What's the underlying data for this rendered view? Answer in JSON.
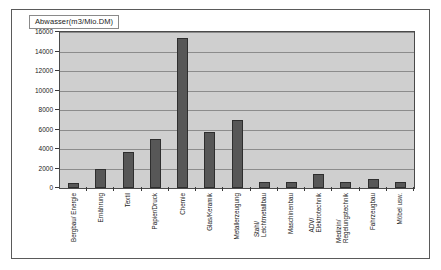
{
  "chart_data": {
    "type": "bar",
    "title": "Abwasser(m3/Mio.DM)",
    "xlabel": "",
    "ylabel": "",
    "ylim": [
      0,
      16000
    ],
    "ytick_step": 2000,
    "yticks": [
      "0",
      "2000",
      "4000",
      "6000",
      "8000",
      "10000",
      "12000",
      "14000",
      "16000"
    ],
    "grid": true,
    "legend_position": "top-left",
    "bar_color": "#575757",
    "plot_background": "#cfcfcf",
    "categories": [
      "Bergbau/ Energie",
      "Ernährung",
      "Textil",
      "Papier/Druck",
      "Chemie",
      "Glas/Keramik",
      "Metallerzeugung",
      "Stahl/ Leichtmetallbau",
      "Maschinenbau",
      "ADV/ Elektrotechnik",
      "Medizin/ Regelungstechnik",
      "Fahrzeugbau",
      "Möbel usw."
    ],
    "category_lines": [
      [
        "Bergbau/ Energie"
      ],
      [
        "Ernährung"
      ],
      [
        "Textil"
      ],
      [
        "Papier/Druck"
      ],
      [
        "Chemie"
      ],
      [
        "Glas/Keramik"
      ],
      [
        "Metallerzeugung"
      ],
      [
        "Stahl/",
        "Leichtmetallbau"
      ],
      [
        "Maschinenbau"
      ],
      [
        "ADV/",
        "Elektrotechnik"
      ],
      [
        "Medizin/",
        "Regelungstechnik"
      ],
      [
        "Fahrzeugbau"
      ],
      [
        "Möbel usw."
      ]
    ],
    "values": [
      500,
      1900,
      3700,
      5000,
      15400,
      5700,
      7000,
      600,
      600,
      1400,
      600,
      900,
      600
    ],
    "series": [
      {
        "name": "Abwasser(m3/Mio.DM)",
        "values": [
          500,
          1900,
          3700,
          5000,
          15400,
          5700,
          7000,
          600,
          600,
          1400,
          600,
          900,
          600
        ]
      }
    ]
  }
}
